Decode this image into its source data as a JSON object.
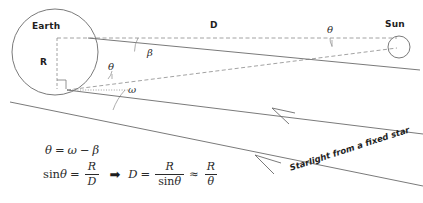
{
  "figure": {
    "type": "astronomy-parallax-diagram",
    "title_visible": false,
    "background_color": "#ffffff",
    "stroke_color": "#5a5a5a",
    "text_color": "#1e1e1e"
  },
  "bodies": {
    "earth": {
      "label": "Earth",
      "center_x": 55,
      "center_y": 52,
      "radius": 43
    },
    "sun": {
      "label": "Sun",
      "center_x": 399,
      "center_y": 47,
      "radius": 11
    }
  },
  "segments": {
    "distance_label": "D",
    "radius_label": "R"
  },
  "angles": {
    "beta": "β",
    "theta_earth": "θ",
    "theta_sun": "θ",
    "omega": "ω"
  },
  "starlight": {
    "caption": "Starlight from a fixed star",
    "ray_count": 2,
    "arrow_direction": "toward-upper-left"
  },
  "formula": {
    "line1": {
      "theta": "θ",
      "equals": "=",
      "omega": "ω",
      "minus": "−",
      "beta": "β"
    },
    "line2": {
      "sin": "sin",
      "theta": "θ",
      "equals": "=",
      "frac1_num": "R",
      "frac1_den": "D",
      "implies": "➡",
      "d": "D",
      "equals2": "=",
      "frac2_num": "R",
      "frac2_den_sin": "sin",
      "frac2_den_theta": "θ",
      "approx": "≈",
      "frac3_num": "R",
      "frac3_den": "θ"
    }
  }
}
